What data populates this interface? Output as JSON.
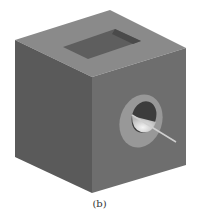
{
  "figure": {
    "caption": "(b)",
    "colors": {
      "background": "#ffffff",
      "top_face": "#8a8a8a",
      "left_face": "#5a5a5a",
      "right_face": "#707070",
      "slot": "#5e5e5e",
      "slot_inner_wall": "#4a4a4a",
      "hole_ring": "#969696",
      "hole_inner_dark": "#3c3c3c",
      "hole_inner_light": "#e6e6e6",
      "rod": "#d0d0d0"
    }
  }
}
